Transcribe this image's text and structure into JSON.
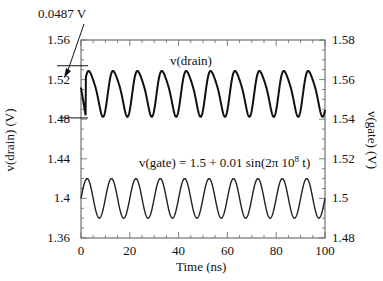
{
  "chart_data": {
    "type": "line",
    "title": "",
    "xlabel": "Time (ns)",
    "ylabel": "v(drain)  (V)",
    "ylabel_right": "v(gate)  (V)",
    "xlim": [
      0,
      100
    ],
    "ylim": [
      1.36,
      1.56
    ],
    "ylim_right": [
      1.48,
      1.58
    ],
    "x_ticks": [
      "0",
      "20",
      "40",
      "60",
      "80",
      "100"
    ],
    "y_ticks_left": [
      "1.56",
      "1.52",
      "1.48",
      "1.44",
      "1.4",
      "1.36"
    ],
    "y_ticks_right": [
      "1.58",
      "1.56",
      "1.54",
      "1.52",
      "1.5",
      "1.48"
    ],
    "grid": false,
    "legend": "none",
    "series": [
      {
        "name": "v(drain)",
        "axis": "left",
        "description": "distorted periodic waveform, period 10 ns, swinging ~1.483 to ~1.532 V",
        "offset": 1.5075,
        "amplitude": 0.0244,
        "period_ns": 10
      },
      {
        "name": "v(gate)",
        "axis": "right",
        "equation": "v(gate) = 1.5 + 0.01 sin(2π 10^8 t)",
        "offset": 1.5,
        "amplitude": 0.01,
        "period_ns": 10
      }
    ],
    "annotations": [
      {
        "text": "0.0487 V",
        "type": "peak-to-peak arrow",
        "upper_level": 1.534,
        "lower_level": 1.4813
      },
      {
        "text": "v(drain)",
        "type": "series label"
      },
      {
        "text": "v(gate) = 1.5 + 0.01 sin(2π 10",
        "superscript": "8",
        "suffix": " t)",
        "type": "series label"
      }
    ]
  },
  "labels": {
    "annotation_ptp": "0.0487 V",
    "drain_label": "v(drain)",
    "gate_label_main": "v(gate) = 1.5 + 0.01 sin(2π 10",
    "gate_label_sup": "8",
    "gate_label_end": " t)",
    "xlabel": "Time (ns)",
    "ylabel_left": "v(drain)  (V)",
    "ylabel_right": "v(gate)  (V)"
  }
}
